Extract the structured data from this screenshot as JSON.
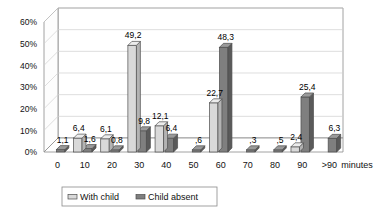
{
  "chart_data": {
    "type": "bar",
    "title": "",
    "subtitle": "",
    "xlabel": "minutes",
    "ylabel": "",
    "categories": [
      "0",
      "10",
      "20",
      "30",
      "40",
      "50",
      "60",
      "70",
      "80",
      "90",
      ">90"
    ],
    "ylim": [
      0,
      60
    ],
    "ytick_labels": [
      "0%",
      "10%",
      "20%",
      "30%",
      "40%",
      "50%",
      "60%"
    ],
    "ytick_values": [
      0,
      10,
      20,
      30,
      40,
      50,
      60
    ],
    "grid": true,
    "legend_position": "bottom",
    "style": "3d-clustered-column",
    "series": [
      {
        "name": "With child",
        "color": "#d9d9d9",
        "values": [
          null,
          6.4,
          6.1,
          49.2,
          12.1,
          null,
          22.7,
          null,
          null,
          2.4,
          null
        ],
        "labels": [
          "",
          "6,4",
          "6,1",
          "49,2",
          "12,1",
          "",
          "22,7",
          "",
          "",
          "2,4",
          ""
        ]
      },
      {
        "name": "Child absent",
        "color": "#7f7f7f",
        "values": [
          1.1,
          1.6,
          0.8,
          9.8,
          6.4,
          0.6,
          48.3,
          0.3,
          0.5,
          25.4,
          6.3
        ],
        "labels": [
          "1,1",
          "1,6",
          "0,8",
          "9,8",
          "6,4",
          ",6",
          "48,3",
          ",3",
          ",5",
          "25,4",
          "6,3"
        ]
      }
    ]
  },
  "legend": {
    "items": [
      {
        "label": "With child",
        "color": "#d9d9d9"
      },
      {
        "label": "Child absent",
        "color": "#7f7f7f"
      }
    ]
  },
  "axes": {
    "x_axis_title": "minutes"
  },
  "colors": {
    "series_with_child": "#d9d9d9",
    "series_child_absent": "#7f7f7f",
    "grid": "#d0d0d0",
    "axis": "#8a8a8a",
    "text": "#111111",
    "background": "#ffffff"
  }
}
